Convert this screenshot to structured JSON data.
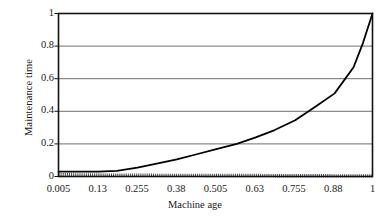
{
  "chart_data": {
    "type": "line",
    "title": "",
    "xlabel": "Machine age",
    "ylabel": "Maintenance time",
    "xlim": [
      0.005,
      1
    ],
    "ylim": [
      0,
      1
    ],
    "grid": true,
    "grid_axis": "y",
    "legend": "none",
    "x_tick_labels": [
      "0.005",
      "0.13",
      "0.255",
      "0.38",
      "0.505",
      "0.63",
      "0.755",
      "0.88",
      "1"
    ],
    "y_tick_labels": [
      "0",
      "0.2",
      "0.4",
      "0.6",
      "0.8",
      "1"
    ],
    "y_ticks": [
      0,
      0.2,
      0.4,
      0.6,
      0.8,
      1
    ],
    "x": [
      0.005,
      0.068,
      0.13,
      0.19,
      0.255,
      0.32,
      0.38,
      0.44,
      0.505,
      0.57,
      0.63,
      0.69,
      0.755,
      0.82,
      0.88,
      0.94,
      0.97,
      1
    ],
    "series": [
      {
        "name": "maintenance-time-curve",
        "style": "solid",
        "color": "#000000",
        "values": [
          0.03,
          0.03,
          0.03,
          0.035,
          0.055,
          0.08,
          0.105,
          0.135,
          0.168,
          0.2,
          0.24,
          0.285,
          0.345,
          0.43,
          0.51,
          0.67,
          0.82,
          1.0
        ]
      },
      {
        "name": "baseline-series",
        "style": "dotted",
        "color": "#444444",
        "values": [
          0.012,
          0.01,
          0.009,
          0.008,
          0.008,
          0.007,
          0.007,
          0.007,
          0.006,
          0.006,
          0.006,
          0.005,
          0.005,
          0.005,
          0.004,
          0.004,
          0.004,
          0.004
        ]
      }
    ]
  },
  "axis": {
    "y_title": "Maintenance time",
    "x_title": "Machine age"
  }
}
